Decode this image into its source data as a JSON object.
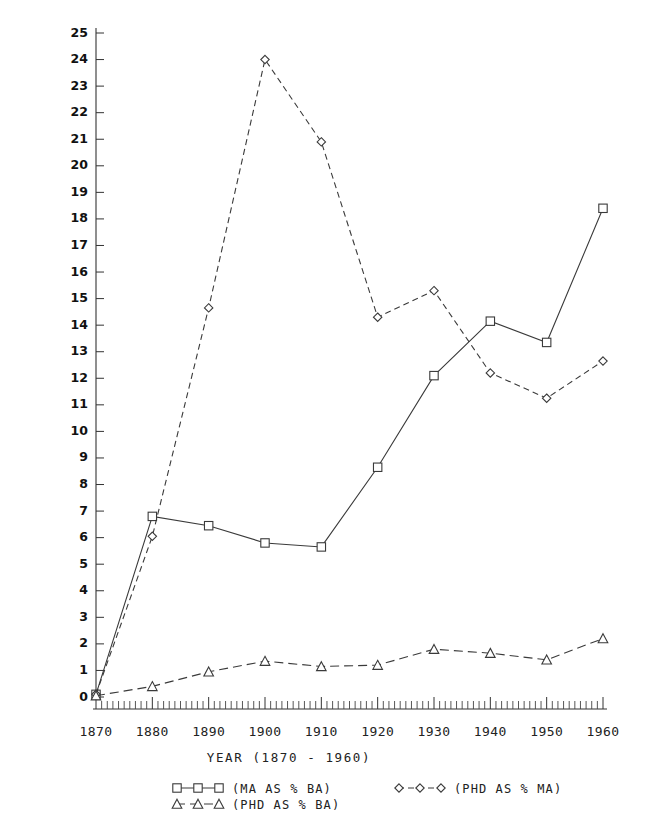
{
  "chart_data": {
    "type": "line",
    "title": "",
    "xlabel": "YEAR (1870 - 1960)",
    "ylabel": "",
    "x": [
      1870,
      1880,
      1890,
      1900,
      1910,
      1920,
      1930,
      1940,
      1950,
      1960
    ],
    "xlim": [
      1870,
      1960
    ],
    "ylim": [
      0,
      25
    ],
    "xticks": [
      1870,
      1880,
      1890,
      1900,
      1910,
      1920,
      1930,
      1940,
      1950,
      1960
    ],
    "yticks": [
      0,
      1,
      2,
      3,
      4,
      5,
      6,
      7,
      8,
      9,
      10,
      11,
      12,
      13,
      14,
      15,
      16,
      17,
      18,
      19,
      20,
      21,
      22,
      23,
      24,
      25
    ],
    "xtick_labels": [
      "1870",
      "1880",
      "1890",
      "1900",
      "1910",
      "1920",
      "1930",
      "1940",
      "1950",
      "1960"
    ],
    "ytick_labels": [
      "0",
      "1",
      "2",
      "3",
      "4",
      "5",
      "6",
      "7",
      "8",
      "9",
      "10",
      "11",
      "12",
      "13",
      "14",
      "15",
      "16",
      "17",
      "18",
      "19",
      "20",
      "21",
      "22",
      "23",
      "24",
      "25"
    ],
    "minor_ticks_per_decade": 10,
    "grid": false,
    "legend_position": "below-axis",
    "series": [
      {
        "name": "(MA AS % BA)",
        "marker": "square",
        "linestyle": "solid",
        "color": "#3a3a3a",
        "values": [
          0.1,
          6.8,
          6.45,
          5.8,
          5.65,
          8.65,
          12.1,
          14.15,
          13.35,
          18.4
        ]
      },
      {
        "name": "(PHD AS % MA)",
        "marker": "diamond",
        "linestyle": "dashed",
        "color": "#3a3a3a",
        "values": [
          0.1,
          6.05,
          14.65,
          24.0,
          20.9,
          14.3,
          15.3,
          12.2,
          11.25,
          12.65
        ]
      },
      {
        "name": "(PHD AS % BA)",
        "marker": "triangle",
        "linestyle": "dashed-long",
        "color": "#3a3a3a",
        "values": [
          0.05,
          0.4,
          0.95,
          1.35,
          1.15,
          1.2,
          1.8,
          1.65,
          1.4,
          2.2
        ]
      }
    ]
  },
  "legend": {
    "entries": [
      {
        "label": "(MA AS % BA)",
        "marker": "square",
        "linestyle": "solid"
      },
      {
        "label": "(PHD AS % BA)",
        "marker": "triangle",
        "linestyle": "dashed-long"
      },
      {
        "label": "(PHD AS % MA)",
        "marker": "diamond",
        "linestyle": "dashed"
      }
    ]
  },
  "axis_title": "YEAR (1870 - 1960)"
}
